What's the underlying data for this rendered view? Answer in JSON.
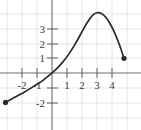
{
  "chart_data": {
    "type": "line",
    "title": "",
    "xlabel": "",
    "ylabel": "",
    "xlim": [
      -3.45,
      5.9
    ],
    "ylim": [
      -2.55,
      4.95
    ],
    "grid": true,
    "grid_spacing": 1,
    "legend": "none",
    "x_ticks": [
      -2,
      -1,
      1,
      2,
      3,
      4
    ],
    "y_ticks": [
      -2,
      1,
      2,
      3
    ],
    "x_tick_labels": [
      "-2",
      "-1",
      "1",
      "2",
      "3",
      "4"
    ],
    "y_tick_labels": [
      "-2",
      "1",
      "2",
      "3"
    ],
    "axis_color": "#6b6b6b",
    "grid_color": "#dcdce4",
    "curve_color": "#2b2b2b",
    "endpoints": [
      {
        "x": -3.1,
        "y": -2.0,
        "style": "filled"
      },
      {
        "x": 4.8,
        "y": 1.0,
        "style": "filled"
      }
    ],
    "series": [
      {
        "name": "curve",
        "x": [
          -3.1,
          -2.6,
          -2.2,
          -1.8,
          -1.4,
          -1.0,
          -0.6,
          -0.2,
          0.0,
          0.3,
          0.7,
          1.1,
          1.5,
          1.9,
          2.3,
          2.7,
          3.0,
          3.3,
          3.6,
          3.9,
          4.2,
          4.5,
          4.8
        ],
        "y": [
          -2.0,
          -1.72,
          -1.5,
          -1.27,
          -1.02,
          -0.77,
          -0.5,
          -0.17,
          0.0,
          0.28,
          0.72,
          1.25,
          1.9,
          2.62,
          3.35,
          3.92,
          4.1,
          4.05,
          3.78,
          3.3,
          2.68,
          1.9,
          1.0
        ]
      }
    ]
  }
}
